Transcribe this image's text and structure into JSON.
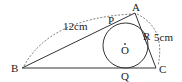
{
  "diagram": {
    "points": {
      "A": {
        "label": "A",
        "x": 135,
        "y": 13
      },
      "B": {
        "label": "B",
        "x": 22,
        "y": 68
      },
      "C": {
        "label": "C",
        "x": 156,
        "y": 68
      },
      "P": {
        "label": "P",
        "x": 114,
        "y": 23
      },
      "Q": {
        "label": "Q",
        "x": 125,
        "y": 68
      },
      "R": {
        "label": "R",
        "x": 146,
        "y": 38
      },
      "O": {
        "label": "O",
        "x": 125,
        "y": 44
      }
    },
    "circle": {
      "cx": 125.5,
      "cy": 45.5,
      "r": 22.5
    },
    "measurements": {
      "AB": "12cm",
      "AC": "5cm"
    },
    "colors": {
      "stroke": "#333333",
      "background": "#ffffff"
    }
  }
}
